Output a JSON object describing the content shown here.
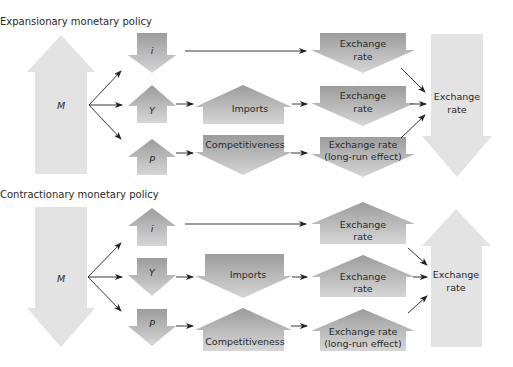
{
  "panels": [
    {
      "title": "Expansionary monetary policy",
      "money": {
        "label": "M",
        "direction": "up"
      },
      "channels": [
        {
          "variable": "i",
          "variable_direction": "down",
          "intermediate": null,
          "exchange_rate_label": [
            "Exchange",
            "rate"
          ],
          "exchange_rate_direction": "down"
        },
        {
          "variable": "Y",
          "variable_direction": "up",
          "intermediate": "Imports",
          "intermediate_direction": "up",
          "exchange_rate_label": [
            "Exchange",
            "rate"
          ],
          "exchange_rate_direction": "down"
        },
        {
          "variable": "P",
          "variable_direction": "up",
          "intermediate": "Competitiveness",
          "intermediate_direction": "down",
          "exchange_rate_label": [
            "Exchange rate",
            "(long-run effect)"
          ],
          "exchange_rate_direction": "down"
        }
      ],
      "result": {
        "label": [
          "Exchange",
          "rate"
        ],
        "direction": "down"
      }
    },
    {
      "title": "Contractionary monetary policy",
      "money": {
        "label": "M",
        "direction": "down"
      },
      "channels": [
        {
          "variable": "i",
          "variable_direction": "up",
          "intermediate": null,
          "exchange_rate_label": [
            "Exchange",
            "rate"
          ],
          "exchange_rate_direction": "up"
        },
        {
          "variable": "Y",
          "variable_direction": "down",
          "intermediate": "Imports",
          "intermediate_direction": "down",
          "exchange_rate_label": [
            "Exchange",
            "rate"
          ],
          "exchange_rate_direction": "up"
        },
        {
          "variable": "P",
          "variable_direction": "down",
          "intermediate": "Competitiveness",
          "intermediate_direction": "up",
          "exchange_rate_label": [
            "Exchange rate",
            "(long-run effect)"
          ],
          "exchange_rate_direction": "up"
        }
      ],
      "result": {
        "label": [
          "Exchange",
          "rate"
        ],
        "direction": "up"
      }
    }
  ],
  "colors": {
    "big_arrow": "#e3e3e3",
    "mid_arrow_top": "#9c9c9c",
    "mid_arrow_bottom": "#d6d6d6",
    "connector": "#222222",
    "text": "#2a2a2a"
  }
}
